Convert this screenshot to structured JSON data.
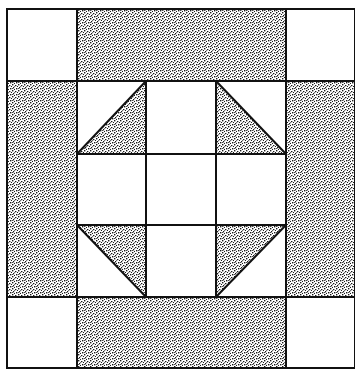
{
  "colors": {
    "background": "#ffffff",
    "line": "#111111",
    "stipple_dark": "#1a1a1a",
    "stipple_light": "#ffffff"
  },
  "block": {
    "frame": {
      "x": 7,
      "y": 9,
      "width": 348,
      "height": 359
    },
    "columns": [
      7,
      77,
      146,
      216,
      286,
      355
    ],
    "rows": [
      9,
      81,
      154,
      225,
      297,
      368
    ],
    "outer_corners": [
      {
        "name": "top-left",
        "fill": "white"
      },
      {
        "name": "top-right",
        "fill": "white"
      },
      {
        "name": "bottom-left",
        "fill": "white"
      },
      {
        "name": "bottom-right",
        "fill": "white"
      }
    ],
    "border_bars": [
      {
        "name": "top",
        "fill": "stipple"
      },
      {
        "name": "bottom",
        "fill": "stipple"
      },
      {
        "name": "left",
        "fill": "stipple"
      },
      {
        "name": "right",
        "fill": "stipple"
      }
    ],
    "center_grid": {
      "cells": 9,
      "half_square_triangles": [
        {
          "position": "top-left",
          "shaded": "bottom-right"
        },
        {
          "position": "top-right",
          "shaded": "bottom-left"
        },
        {
          "position": "bottom-left",
          "shaded": "top-right"
        },
        {
          "position": "bottom-right",
          "shaded": "top-left"
        }
      ],
      "plain_squares": [
        "top-center",
        "middle-left",
        "center",
        "middle-right",
        "bottom-center"
      ]
    }
  }
}
